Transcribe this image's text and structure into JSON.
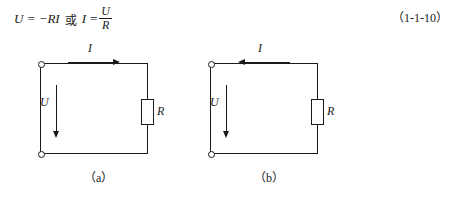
{
  "formula": {
    "lhs": "U = −RI",
    "conjunction": "或",
    "rhs_lead": "I =",
    "fraction_numerator": "U",
    "fraction_denominator": "R"
  },
  "equation_number": "（1-1-10）",
  "figures": [
    {
      "id": "a",
      "caption": "（a）",
      "current_label": "I",
      "current_direction": "right",
      "voltage_label": "U",
      "voltage_direction": "down",
      "resistor_label": "R",
      "terminals": 2
    },
    {
      "id": "b",
      "caption": "（b）",
      "current_label": "I",
      "current_direction": "left",
      "voltage_label": "U",
      "voltage_direction": "down",
      "resistor_label": "R",
      "terminals": 2
    }
  ],
  "colors": {
    "ink": "#1a1a1a",
    "paper": "#ffffff"
  }
}
